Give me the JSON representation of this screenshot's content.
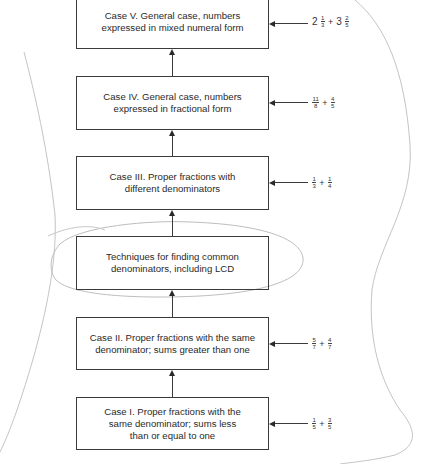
{
  "diagram": {
    "type": "flowchart-vertical",
    "direction": "bottom-to-top",
    "boxes": [
      {
        "id": "case5",
        "label": "Case V.   General case, numbers\nexpressed in mixed numeral form",
        "top": -6,
        "height": 55
      },
      {
        "id": "case4",
        "label": "Case IV.   General case, numbers\nexpressed in fractional form",
        "top": 76,
        "height": 54
      },
      {
        "id": "case3",
        "label": "Case III.   Proper fractions with\ndifferent denominators",
        "top": 156,
        "height": 54
      },
      {
        "id": "lcd",
        "label": "Techniques for finding common\ndenominators, including LCD",
        "top": 236,
        "height": 54
      },
      {
        "id": "case2",
        "label": "Case II.   Proper fractions with the same\ndenominator; sums greater than one",
        "top": 317,
        "height": 53
      },
      {
        "id": "case1",
        "label": "Case I.   Proper fractions with the\nsame denominator; sums less\nthan or equal to one",
        "top": 397,
        "height": 53
      }
    ],
    "examples": {
      "case5": {
        "whole1": "2",
        "num1": "1",
        "den1": "3",
        "op": "+",
        "whole2": "3",
        "num2": "2",
        "den2": "5"
      },
      "case4": {
        "num1": "11",
        "den1": "8",
        "op": "+",
        "num2": "4",
        "den2": "5"
      },
      "case3": {
        "num1": "1",
        "den1": "3",
        "op": "+",
        "num2": "1",
        "den2": "4"
      },
      "case2": {
        "num1": "5",
        "den1": "7",
        "op": "+",
        "num2": "4",
        "den2": "7"
      },
      "case1": {
        "num1": "1",
        "den1": "5",
        "op": "+",
        "num2": "3",
        "den2": "5"
      }
    },
    "edges": [
      {
        "from": "case1",
        "to": "case2"
      },
      {
        "from": "case2",
        "to": "lcd"
      },
      {
        "from": "lcd",
        "to": "case3"
      },
      {
        "from": "case3",
        "to": "case4"
      },
      {
        "from": "case4",
        "to": "case5"
      }
    ],
    "annotations": {
      "highlighted_box": "lcd",
      "highlight_shape": "hand-drawn ellipse",
      "stroke_color": "#bdbdbd",
      "box_border_color": "#3a3a3a"
    }
  }
}
